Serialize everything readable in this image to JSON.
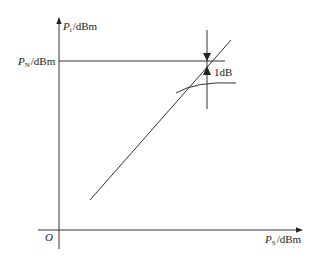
{
  "diagram": {
    "y_axis": {
      "symbol": "P",
      "subscript": "i",
      "unit": "/dBm"
    },
    "x_axis": {
      "symbol": "P",
      "subscript": "S",
      "unit": "/dBm"
    },
    "level_label": {
      "symbol": "P",
      "subscript": "N",
      "unit": "/dBm"
    },
    "origin_label": "O",
    "compression_label": "1dB",
    "colors": {
      "line": "#333333",
      "background": "#ffffff"
    }
  }
}
